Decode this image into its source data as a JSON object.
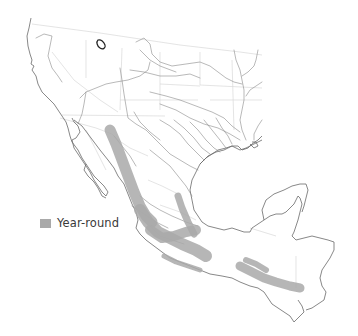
{
  "map": {
    "region": "Western United States, Mexico and northern Central America",
    "colors": {
      "background": "#ffffff",
      "range_year_round": "#a9a9a9",
      "coastline": "#6a6a6a",
      "rivers": "#8a8a8a",
      "borders": "#d9d9d9",
      "outlier_outline": "#222222"
    },
    "features": {
      "outlier_record": "Small outlined isolated occurrence in the northern interior United States",
      "year_round_range": "Band along the Sierra Madre Occidental through central Mexico to Oaxaca, a branch along the Sierra Madre Oriental, a strip along the Pacific slope, and a band through Chiapas/Guatemala"
    }
  },
  "legend": {
    "items": [
      {
        "label": "Year-round",
        "color": "#a9a9a9",
        "icon": "legend-swatch"
      }
    ]
  }
}
